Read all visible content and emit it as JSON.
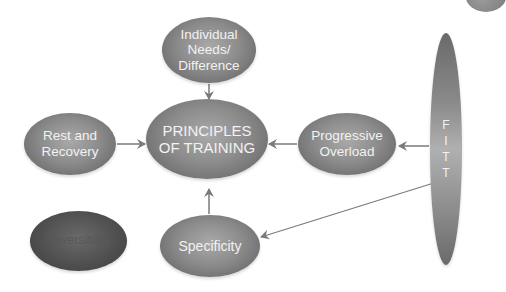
{
  "diagram": {
    "title": "Principles of Training",
    "center": {
      "lines": [
        "PRINCIPLES",
        "OF TRAINING"
      ]
    },
    "nodes": {
      "individual": {
        "lines": [
          "Individual",
          "Needs/",
          "Difference"
        ]
      },
      "rest": {
        "lines": [
          "Rest and",
          "Recovery"
        ]
      },
      "progressive": {
        "lines": [
          "Progressive",
          "Overload"
        ]
      },
      "specificity": {
        "lines": [
          "Specificity"
        ]
      },
      "reversibility": {
        "lines": [
          "Reversibility"
        ]
      },
      "fitt": {
        "letters": [
          "F",
          "I",
          "T",
          "T"
        ]
      }
    },
    "edges": [
      {
        "from": "individual",
        "to": "center"
      },
      {
        "from": "rest",
        "to": "center"
      },
      {
        "from": "progressive",
        "to": "center"
      },
      {
        "from": "specificity",
        "to": "center"
      },
      {
        "from": "fitt",
        "to": "progressive"
      },
      {
        "from": "fitt",
        "to": "specificity"
      }
    ],
    "colors": {
      "node_fill": "#8c8c8c",
      "dark_node_fill": "#505050",
      "arrow": "#7a7a7a",
      "text": "#f2f2f2",
      "background": "#ffffff"
    }
  }
}
